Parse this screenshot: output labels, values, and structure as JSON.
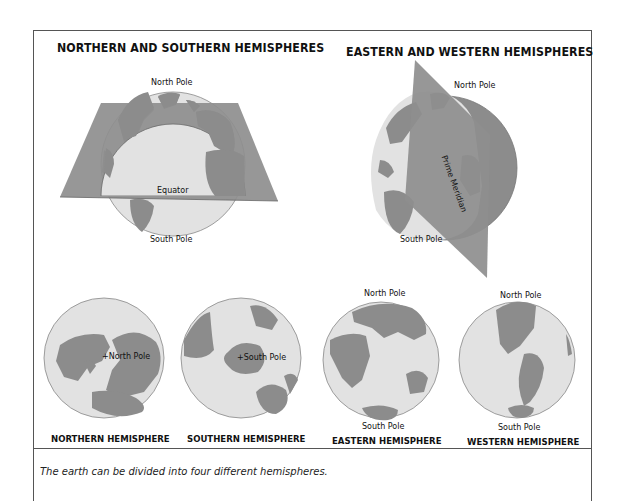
{
  "figure": {
    "panels": {
      "north_south": {
        "title": "NORTHERN AND SOUTHERN HEMISPHERES",
        "labels": {
          "north_pole": "North Pole",
          "equator": "Equator",
          "south_pole": "South Pole"
        }
      },
      "east_west": {
        "title": "EASTERN AND WESTERN HEMISPHERES",
        "labels": {
          "north_pole": "North Pole",
          "prime_meridian": "Prime Meridian",
          "south_pole": "South Pole"
        }
      }
    },
    "hemispheres": [
      {
        "name": "NORTHERN HEMISPHERE",
        "pole_label": "+North Pole"
      },
      {
        "name": "SOUTHERN HEMISPHERE",
        "pole_label": "+South Pole"
      },
      {
        "name": "EASTERN HEMISPHERE",
        "top_label": "North Pole",
        "bottom_label": "South Pole"
      },
      {
        "name": "WESTERN HEMISPHERE",
        "top_label": "North Pole",
        "bottom_label": "South Pole"
      }
    ],
    "caption": "The earth can be divided into four different hemispheres.",
    "colors": {
      "land": "#8c8c8c",
      "ocean": "#e2e2e2",
      "plane": "#8e8e8e",
      "border": "#555555"
    }
  }
}
